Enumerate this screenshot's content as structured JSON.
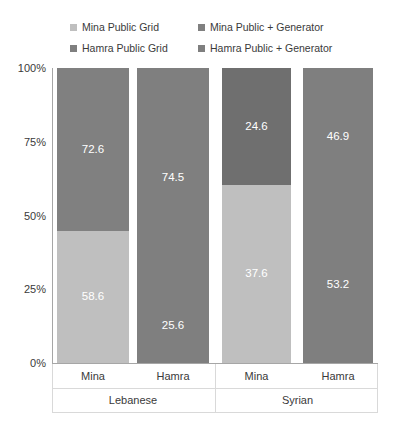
{
  "chart_data": {
    "type": "bar",
    "title": "",
    "xlabel": "",
    "ylabel": "",
    "ylim": [
      0,
      100
    ],
    "grid": false,
    "stacked": true,
    "legend_position": "top",
    "y_ticks": [
      "0%",
      "25%",
      "50%",
      "75%",
      "100%"
    ],
    "y_tick_values": [
      0,
      25,
      50,
      75,
      100
    ],
    "groups": [
      {
        "name": "Lebanese",
        "categories": [
          "Mina",
          "Hamra"
        ]
      },
      {
        "name": "Syrian",
        "categories": [
          "Mina",
          "Hamra"
        ]
      }
    ],
    "categories": [
      "Mina",
      "Hamra",
      "Mina",
      "Hamra"
    ],
    "legend": [
      {
        "name": "Mina Public Grid",
        "color": "#bfbfbf"
      },
      {
        "name": "Mina Public + Generator",
        "color": "#808080"
      },
      {
        "name": "Hamra Public Grid",
        "color": "#7f7f7f"
      },
      {
        "name": "Hamra Public + Generator",
        "color": "#7f7f7f"
      }
    ],
    "bars": [
      {
        "group": "Lebanese",
        "category": "Mina",
        "bottom": {
          "series": "Mina Public Grid",
          "value": 58.6,
          "label": "58.6",
          "color": "#bfbfbf"
        },
        "top": {
          "series": "Mina Public + Generator",
          "value": 72.6,
          "label": "72.6",
          "color": "#808080"
        }
      },
      {
        "group": "Lebanese",
        "category": "Hamra",
        "bottom": {
          "series": "Hamra Public Grid",
          "value": 25.6,
          "label": "25.6",
          "color": "#7f7f7f"
        },
        "top": {
          "series": "Hamra Public + Generator",
          "value": 74.5,
          "label": "74.5",
          "color": "#7f7f7f"
        }
      },
      {
        "group": "Syrian",
        "category": "Mina",
        "bottom": {
          "series": "Mina Public Grid",
          "value": 37.6,
          "label": "37.6",
          "color": "#bfbfbf"
        },
        "top": {
          "series": "Mina Public + Generator",
          "value": 24.6,
          "label": "24.6",
          "color": "#6f6f6f"
        }
      },
      {
        "group": "Syrian",
        "category": "Hamra",
        "bottom": {
          "series": "Hamra Public Grid",
          "value": 53.2,
          "label": "53.2",
          "color": "#7f7f7f"
        },
        "top": {
          "series": "Hamra Public + Generator",
          "value": 46.9,
          "label": "46.9",
          "color": "#7f7f7f"
        }
      }
    ]
  },
  "colors": {
    "light_gray": "#bfbfbf",
    "mid_gray": "#808080",
    "dark_gray": "#6f6f6f",
    "axis": "#a6a6a6",
    "text": "#3a3a3a",
    "label_text": "#ffffff",
    "background": "#ffffff"
  }
}
